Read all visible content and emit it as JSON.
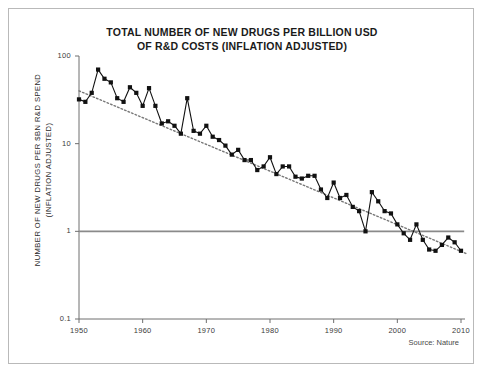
{
  "frame": {
    "title_line1": "TOTAL NUMBER OF NEW DRUGS PER BILLION USD",
    "title_line2": "OF R&D COSTS (INFLATION ADJUSTED)",
    "source": "Source: Nature",
    "border_color": "#b9b9b9",
    "background": "#ffffff"
  },
  "chart_data": {
    "type": "line",
    "title": "TOTAL NUMBER OF NEW DRUGS PER BILLION USD OF R&D COSTS (INFLATION ADJUSTED)",
    "xlabel": "",
    "ylabel": "NUMBER OF NEW DRUGS PER $BN R&D SPEND (INFLATION ADJUSTED)",
    "ylabel_line1": "NUMBER OF NEW DRUGS PER $BN R&D SPEND",
    "ylabel_line2": "(INFLATION ADJUSTED)",
    "yscale": "log",
    "ylim": [
      0.1,
      100
    ],
    "xlim": [
      1950,
      2011
    ],
    "grid": false,
    "legend": false,
    "marker": "square",
    "series_color": "#111111",
    "trend_color": "#777777",
    "ytick_values": [
      100,
      10,
      1,
      0.1
    ],
    "ytick_labels": [
      "100",
      "10",
      "1",
      "0.1"
    ],
    "xtick_values": [
      1950,
      1960,
      1970,
      1980,
      1990,
      2000,
      2010
    ],
    "xtick_labels": [
      "1950",
      "1960",
      "1970",
      "1980",
      "1990",
      "2000",
      "2010"
    ],
    "reference_line": {
      "y": 1,
      "x_start": 1950,
      "x_end": 2010.5,
      "color": "#8a8a8a"
    },
    "trendline": {
      "x_start": 1950,
      "y_start": 40,
      "x_end": 2011,
      "y_end": 0.55,
      "style": "dotted"
    },
    "x": [
      1950,
      1951,
      1952,
      1953,
      1954,
      1955,
      1956,
      1957,
      1958,
      1959,
      1960,
      1961,
      1962,
      1963,
      1964,
      1965,
      1966,
      1967,
      1968,
      1969,
      1970,
      1971,
      1972,
      1973,
      1974,
      1975,
      1976,
      1977,
      1978,
      1979,
      1980,
      1981,
      1982,
      1983,
      1984,
      1985,
      1986,
      1987,
      1988,
      1989,
      1990,
      1991,
      1992,
      1993,
      1994,
      1995,
      1996,
      1997,
      1998,
      1999,
      2000,
      2001,
      2002,
      2003,
      2004,
      2005,
      2006,
      2007,
      2008,
      2009,
      2010
    ],
    "values": [
      32,
      30,
      38,
      70,
      55,
      50,
      33,
      30,
      44,
      38,
      27,
      43,
      27,
      17,
      18,
      16,
      13,
      33,
      14,
      13,
      16,
      12,
      11,
      9.5,
      7.5,
      8.5,
      6.5,
      6.5,
      5,
      5.5,
      7,
      4.5,
      5.5,
      5.5,
      4.2,
      4,
      4.3,
      4.3,
      3.0,
      2.4,
      3.6,
      2.4,
      2.6,
      1.9,
      1.7,
      1.0,
      2.8,
      2.2,
      1.7,
      1.6,
      1.2,
      0.95,
      0.8,
      1.2,
      0.8,
      0.62,
      0.6,
      0.7,
      0.85,
      0.75,
      0.6
    ]
  }
}
